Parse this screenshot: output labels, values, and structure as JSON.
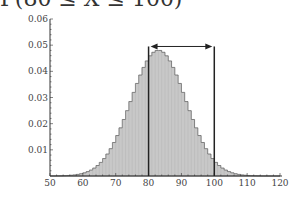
{
  "chart_data": {
    "type": "bar",
    "title": "P(80 ≤ X ≤ 100)",
    "xlabel": "",
    "ylabel": "",
    "xlim": [
      50,
      120
    ],
    "ylim": [
      0,
      0.06
    ],
    "grid": false,
    "legend": null,
    "x_ticks": [
      50,
      60,
      70,
      80,
      90,
      100,
      110,
      120
    ],
    "y_ticks": [
      0.01,
      0.02,
      0.03,
      0.04,
      0.05,
      0.06
    ],
    "y_tick_labels": [
      "0.01",
      "0.02",
      "0.03",
      "0.04",
      "0.05",
      "0.06"
    ],
    "distribution": {
      "shape": "bell (binomial/normal approx)",
      "mean": 83,
      "sd": 8.3
    },
    "shaded_region": [
      80,
      100
    ],
    "annotations": [
      {
        "type": "vertical-line",
        "x": 80
      },
      {
        "type": "vertical-line",
        "x": 100
      },
      {
        "type": "double-arrow",
        "from": 80,
        "to": 100,
        "y": 0.0495
      }
    ],
    "fill_color": "#c8c8c8",
    "line_color": "#222222"
  }
}
